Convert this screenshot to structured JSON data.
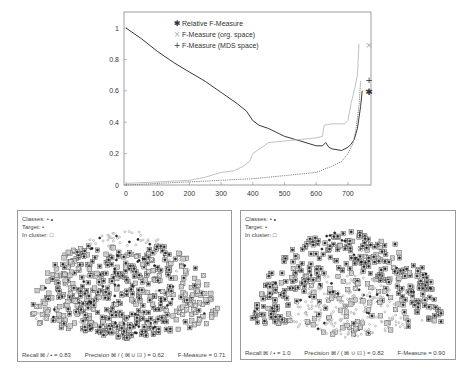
{
  "chart_data": [
    {
      "type": "line",
      "title": "",
      "xlabel": "",
      "ylabel": "",
      "xlim": [
        0,
        770
      ],
      "ylim": [
        0,
        1.05
      ],
      "x_ticks": [
        "0",
        "100",
        "200",
        "300",
        "400",
        "500",
        "600",
        "700"
      ],
      "y_ticks": [
        "0",
        "0.2",
        "0.4",
        "0.6",
        "0.8",
        "1"
      ],
      "grid": false,
      "legend_position": "top-left-inside",
      "series": [
        {
          "name": "Relative F-Measure",
          "marker": "✱",
          "color": "#222222",
          "style": "solid",
          "end_marker_value": 0.59,
          "points": [
            [
              0,
              1.0
            ],
            [
              50,
              0.93
            ],
            [
              100,
              0.85
            ],
            [
              150,
              0.78
            ],
            [
              200,
              0.72
            ],
            [
              250,
              0.66
            ],
            [
              300,
              0.59
            ],
            [
              350,
              0.52
            ],
            [
              380,
              0.47
            ],
            [
              400,
              0.41
            ],
            [
              420,
              0.38
            ],
            [
              450,
              0.36
            ],
            [
              500,
              0.31
            ],
            [
              550,
              0.28
            ],
            [
              600,
              0.25
            ],
            [
              620,
              0.25
            ],
            [
              630,
              0.27
            ],
            [
              640,
              0.24
            ],
            [
              650,
              0.23
            ],
            [
              680,
              0.22
            ],
            [
              700,
              0.24
            ],
            [
              710,
              0.26
            ],
            [
              720,
              0.29
            ],
            [
              730,
              0.36
            ],
            [
              740,
              0.5
            ],
            [
              745,
              0.6
            ]
          ]
        },
        {
          "name": "F-Measure (org. space)",
          "marker": "×",
          "color": "#bbbbbb",
          "style": "solid",
          "end_marker_value": 0.89,
          "points": [
            [
              0,
              0.01
            ],
            [
              100,
              0.02
            ],
            [
              200,
              0.03
            ],
            [
              250,
              0.05
            ],
            [
              300,
              0.08
            ],
            [
              340,
              0.09
            ],
            [
              370,
              0.12
            ],
            [
              390,
              0.15
            ],
            [
              400,
              0.2
            ],
            [
              450,
              0.27
            ],
            [
              500,
              0.28
            ],
            [
              550,
              0.29
            ],
            [
              600,
              0.3
            ],
            [
              620,
              0.31
            ],
            [
              625,
              0.38
            ],
            [
              650,
              0.39
            ],
            [
              690,
              0.39
            ],
            [
              700,
              0.41
            ],
            [
              710,
              0.52
            ],
            [
              720,
              0.6
            ],
            [
              730,
              0.7
            ],
            [
              735,
              0.9
            ]
          ]
        },
        {
          "name": "F-Measure (MDS space)",
          "marker": "+",
          "color": "#777777",
          "style": "dotted",
          "end_marker_value": 0.67,
          "points": [
            [
              0,
              0.0
            ],
            [
              100,
              0.01
            ],
            [
              200,
              0.02
            ],
            [
              300,
              0.03
            ],
            [
              400,
              0.04
            ],
            [
              450,
              0.05
            ],
            [
              500,
              0.06
            ],
            [
              550,
              0.07
            ],
            [
              600,
              0.08
            ],
            [
              650,
              0.12
            ],
            [
              680,
              0.15
            ],
            [
              700,
              0.2
            ],
            [
              715,
              0.26
            ],
            [
              725,
              0.35
            ],
            [
              735,
              0.5
            ],
            [
              740,
              0.66
            ]
          ]
        }
      ]
    },
    {
      "type": "scatter",
      "panel": "left",
      "legend": {
        "classes": "Classes:",
        "classes_symbols": "• ∘",
        "target": "Target:",
        "target_symbol": "•",
        "in_cluster": "In cluster:",
        "in_cluster_symbol": "□"
      },
      "recall": "0.83",
      "precision": "0.62",
      "f_measure": "0.71"
    },
    {
      "type": "scatter",
      "panel": "right",
      "legend": {
        "classes": "Classes:",
        "classes_symbols": "• ∘",
        "target": "Target:",
        "target_symbol": "•",
        "in_cluster": "In cluster:",
        "in_cluster_symbol": "□"
      },
      "recall": "1.0",
      "precision": "0.82",
      "f_measure": "0.90"
    }
  ],
  "panels": {
    "left": {
      "legend_classes": "Classes:  • ∘",
      "legend_target": "Target:  •",
      "legend_in_cluster": "In cluster: □",
      "recall_text": "Recall ⊠ / • = 0.83",
      "precision_text": "Precision  ⊠ / ( ⊠ ∪ ⊡ ) = 0.62",
      "fmeasure_text": "F-Measure = 0.71"
    },
    "right": {
      "legend_classes": "Classes:  • ∘",
      "legend_target": "Target:  •",
      "legend_in_cluster": "In cluster: □",
      "recall_text": "Recall ⊠ / • = 1.0",
      "precision_text": "Precision  ⊠ / ( ⊠ ∪ ⊡ ) = 0.82",
      "fmeasure_text": "F-Measure = 0.90"
    }
  }
}
